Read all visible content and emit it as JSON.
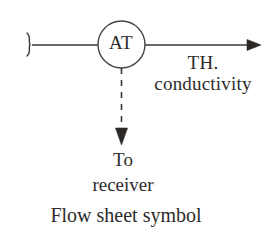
{
  "diagram": {
    "title_caption": "Flow sheet symbol",
    "instrument_bubble": {
      "tag": "AT",
      "shape": "circle"
    },
    "process_line": {
      "start_marker": "break-squiggle",
      "end_marker": "arrowhead-right",
      "style": "solid"
    },
    "signal_line": {
      "style": "dashed",
      "end_marker": "arrowhead-down"
    },
    "labels": {
      "output_line1": "TH.",
      "output_line2": "conductivity",
      "destination_line1": "To",
      "destination_line2": "receiver"
    },
    "colors": {
      "background": "#ffffff",
      "ink": "#2e2b2b",
      "line": "#3a3736"
    }
  }
}
